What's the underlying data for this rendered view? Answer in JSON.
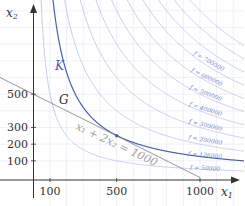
{
  "chart_data": {
    "type": "line",
    "title": "",
    "xlabel": "x1",
    "ylabel": "x2",
    "xlim": [
      0,
      1260
    ],
    "ylim": [
      0,
      1060
    ],
    "x_ticks": [
      100,
      500,
      1000
    ],
    "y_ticks": [
      100,
      200,
      300,
      500
    ],
    "grid": true,
    "series": [
      {
        "name": "f = 50000",
        "kind": "level-curve",
        "equation": "x1*x2 = 50000",
        "level": 50000
      },
      {
        "name": "f = 126000",
        "kind": "level-curve",
        "equation": "x1*x2 = 126000",
        "level": 126000,
        "label": "K",
        "highlight": true
      },
      {
        "name": "f = 200000",
        "kind": "level-curve",
        "equation": "x1*x2 = 200000",
        "level": 200000
      },
      {
        "name": "f = 300000",
        "kind": "level-curve",
        "equation": "x1*x2 = 300000",
        "level": 300000
      },
      {
        "name": "f = 400000",
        "kind": "level-curve",
        "equation": "x1*x2 = 400000",
        "level": 400000
      },
      {
        "name": "f = 500000",
        "kind": "level-curve",
        "equation": "x1*x2 = 500000",
        "level": 500000
      },
      {
        "name": "f = 600000",
        "kind": "level-curve",
        "equation": "x1*x2 = 600000",
        "level": 600000
      },
      {
        "name": "f = 700000",
        "kind": "level-curve",
        "equation": "x1*x2 = 700000",
        "level": 700000
      },
      {
        "name": "f = 800000",
        "kind": "level-curve",
        "equation": "x1*x2 = 800000",
        "level": 800000
      },
      {
        "name": "f = 900000",
        "kind": "level-curve",
        "equation": "x1*x2 = 900000",
        "level": 900000
      },
      {
        "name": "f = 1000000",
        "kind": "level-curve",
        "equation": "x1*x2 = 1000000",
        "level": 1000000
      },
      {
        "name": "x1 + 2x2 = 1000",
        "kind": "line",
        "label": "G",
        "points": [
          [
            0,
            500
          ],
          [
            1000,
            0
          ]
        ]
      }
    ],
    "annotations": [
      {
        "text": "x1 + 2x2 = 1000",
        "target": "line G"
      },
      {
        "text": "K",
        "target": "curve f = 126000"
      },
      {
        "text": "G",
        "target": "constraint line"
      },
      {
        "text": "tangent point",
        "point": [
          500,
          250
        ]
      }
    ]
  },
  "labels": {
    "x_axis": "x",
    "x_axis_sub": "1",
    "y_axis": "x",
    "y_axis_sub": "2",
    "curve_K": "K",
    "line_G": "G",
    "line_equation": "x₁ + 2x₂ = 1000",
    "x_ticks": [
      "100",
      "500",
      "1000"
    ],
    "y_ticks": [
      "500",
      "300",
      "200",
      "100"
    ],
    "f_labels": [
      "f = 700000",
      "f = 600000",
      "f = 500000",
      "f = 400000",
      "f = 300000",
      "f = 200000",
      "f = 126000",
      "f = 50000"
    ]
  },
  "colors": {
    "axis": "#333333",
    "grid": "#e6e8f0",
    "level_curve": "#b7c0e6",
    "highlight_curve": "#4a5fb5",
    "constraint_line": "#8a8a8a",
    "tangent_point": "#4a5fb5"
  }
}
